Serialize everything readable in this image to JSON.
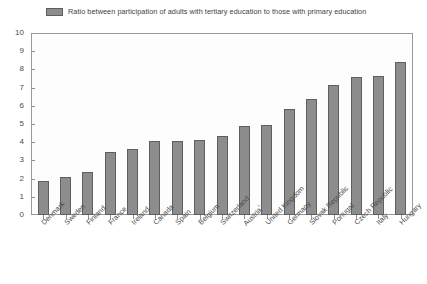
{
  "legend": {
    "label": "Ratio between participation of adults with tertiary education to those with primary education",
    "swatch_color": "#8d8d8d",
    "position": "top-left"
  },
  "axes": {
    "y_ticks": [
      "10",
      "9",
      "8",
      "7",
      "6",
      "5",
      "4",
      "3",
      "2",
      "1",
      "0"
    ],
    "y_min": 0,
    "y_max": 10,
    "ylabel": "",
    "xlabel": "",
    "grid": false
  },
  "footnote_marker": "1",
  "chart_data": {
    "type": "bar",
    "title": "",
    "subtitle": "",
    "xlabel": "",
    "ylabel": "",
    "ylim": [
      0,
      10
    ],
    "grid": false,
    "legend_position": "top-left",
    "series_name": "Ratio between participation of adults with tertiary education to those with primary education",
    "bar_color": "#8d8d8d",
    "bar_edge_color": "#5f5f5f",
    "categories": [
      "Denmark",
      "Sweden",
      "Finland",
      "France",
      "Ireland",
      "Canada",
      "Spain",
      "Belgium",
      "Switzerland",
      "Austria¹",
      "United Kingdom",
      "Germany",
      "Slovak Republic",
      "Portugal",
      "Czech Republic",
      "Italy",
      "Hungary"
    ],
    "values": [
      1.9,
      2.1,
      2.4,
      3.5,
      3.65,
      4.1,
      4.1,
      4.15,
      4.35,
      4.9,
      4.95,
      5.85,
      6.4,
      7.2,
      7.6,
      7.7,
      8.45
    ]
  }
}
